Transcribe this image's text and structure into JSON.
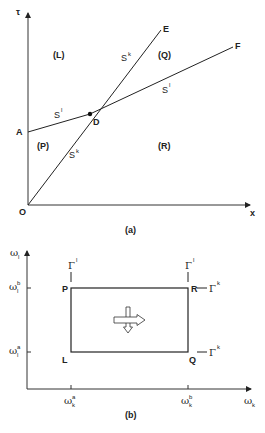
{
  "figure_a": {
    "caption": "(a)",
    "axes": {
      "y_label": "τ",
      "x_label": "x",
      "origin_label": "O"
    },
    "points": {
      "A": "A",
      "D": "D",
      "E": "E",
      "F": "F"
    },
    "regions": {
      "L": "(L)",
      "Q": "(Q)",
      "P": "(P)",
      "R": "(R)"
    },
    "curves": {
      "sk_upper": {
        "base": "S",
        "sup": "k"
      },
      "sk_lower": {
        "base": "S",
        "sup": "k"
      },
      "sl_left": {
        "base": "S",
        "sup": "l"
      },
      "sl_right": {
        "base": "S",
        "sup": "l"
      }
    }
  },
  "figure_b": {
    "caption": "(b)",
    "axes": {
      "y_label": {
        "base": "ω",
        "sub": "l"
      },
      "x_label": {
        "base": "ω",
        "sub": "k"
      }
    },
    "ticks": {
      "y_b": {
        "base": "ω",
        "sub": "l",
        "sup": "b"
      },
      "y_a": {
        "base": "ω",
        "sub": "l",
        "sup": "a"
      },
      "x_a": {
        "base": "ω",
        "sub": "k",
        "sup": "a"
      },
      "x_b": {
        "base": "ω",
        "sub": "k",
        "sup": "b"
      }
    },
    "corners": {
      "P": "P",
      "R": "R",
      "L": "L",
      "Q": "Q"
    },
    "boundaries": {
      "gamma_l_p": {
        "base": "Γ",
        "sup": "l"
      },
      "gamma_l_r": {
        "base": "Γ",
        "sup": "l"
      },
      "gamma_k_r": {
        "base": "Γ",
        "sup": "k"
      },
      "gamma_k_q": {
        "base": "Γ",
        "sup": "k"
      }
    }
  }
}
